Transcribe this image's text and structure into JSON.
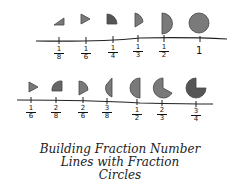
{
  "title": {
    "line1": "Building Fraction Number",
    "line2": "Lines with Fraction",
    "line3": "Circles"
  },
  "colors": {
    "fill": "#7a7a7a",
    "dark": "#555555",
    "line": "#222222"
  },
  "line1": {
    "labels": [
      {
        "num": "1",
        "den": "8"
      },
      {
        "num": "1",
        "den": "6"
      },
      {
        "num": "1",
        "den": "4"
      },
      {
        "num": "1",
        "den": "3"
      },
      {
        "num": "1",
        "den": "2"
      }
    ],
    "whole": "1"
  },
  "line2": {
    "labels": [
      {
        "num": "1",
        "den": "6"
      },
      {
        "num": "2",
        "den": "8"
      },
      {
        "num": "2",
        "den": "6"
      },
      {
        "num": "3",
        "den": "8"
      },
      {
        "num": "1",
        "den": "2"
      },
      {
        "num": "2",
        "den": "3"
      },
      {
        "num": "3",
        "den": "4"
      }
    ]
  }
}
